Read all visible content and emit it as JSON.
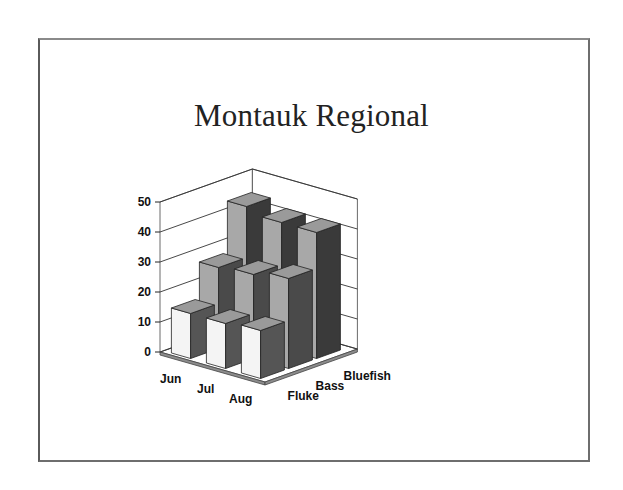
{
  "title": "Montauk Regional",
  "colors": {
    "frame": "#6e6e6e",
    "grid": "#333333",
    "floor": "#8c8c8c",
    "bar_front": "#f4f4f4",
    "bar_side": "#4a4a4a",
    "bar_top": "#9a9a9a",
    "bar_front_back_rows": "#a8a8a8"
  },
  "chart_data": {
    "type": "bar",
    "subtype": "3d-column",
    "title": "Montauk Regional",
    "categories": [
      "Jun",
      "Jul",
      "Aug"
    ],
    "series": [
      {
        "name": "Fluke",
        "values": [
          15,
          15,
          16
        ]
      },
      {
        "name": "Bass",
        "values": [
          27,
          28,
          30
        ]
      },
      {
        "name": "Bluefish",
        "values": [
          44,
          42,
          42
        ]
      }
    ],
    "xlabel": "",
    "ylabel": "",
    "ylim": [
      0,
      50
    ],
    "yticks": [
      0,
      10,
      20,
      30,
      40,
      50
    ],
    "grid": true,
    "legend": "none (series names shown on depth axis)"
  }
}
